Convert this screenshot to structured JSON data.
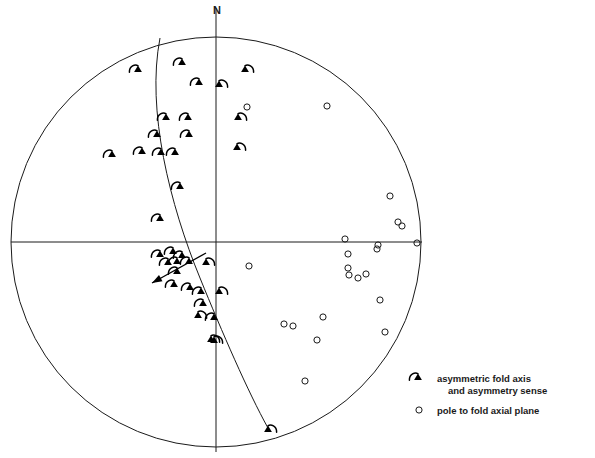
{
  "figure": {
    "name": "equal-area-stereonet",
    "orientation_label": "N",
    "net": {
      "center_x": 216,
      "center_y": 242,
      "radius": 205,
      "stroke": "#1a1a1a",
      "stroke_width": 1.0,
      "axis_vertical_top": 8,
      "axis_vertical_bottom": 452,
      "axis_horizontal_left": 11,
      "axis_horizontal_right": 422
    },
    "girdle": {
      "name": "best-fit-girdle-great-circle",
      "description": "great circle trace through fold axis cluster",
      "path": "M 160,38 C 146,110 170,205 200,278 C 222,332 248,392 268,428",
      "stroke": "#1a1a1a",
      "stroke_width": 1.0
    },
    "fold_axis_arrow": {
      "name": "mean-fold-axis-arrow",
      "x1": 206,
      "y1": 253,
      "x2": 152,
      "y2": 283,
      "stroke": "#000000"
    }
  },
  "chart_data": {
    "type": "scatter",
    "title": "",
    "xlabel": "",
    "ylabel": "",
    "projection": "lower-hemisphere equal-area stereographic net",
    "grid": false,
    "legend_position": "bottom-right",
    "series": [
      {
        "name": "asymmetric fold axis and asymmetry sense",
        "symbol": "filled-triangle-with-arc",
        "count": 35,
        "points": [
          {
            "x": 138,
            "y": 70,
            "sense": "left"
          },
          {
            "x": 182,
            "y": 63,
            "sense": "left"
          },
          {
            "x": 245,
            "y": 70,
            "sense": "right"
          },
          {
            "x": 199,
            "y": 83,
            "sense": "left"
          },
          {
            "x": 219,
            "y": 85,
            "sense": "right"
          },
          {
            "x": 166,
            "y": 118,
            "sense": "left"
          },
          {
            "x": 188,
            "y": 118,
            "sense": "left"
          },
          {
            "x": 238,
            "y": 118,
            "sense": "right"
          },
          {
            "x": 157,
            "y": 135,
            "sense": "left"
          },
          {
            "x": 189,
            "y": 135,
            "sense": "left"
          },
          {
            "x": 237,
            "y": 148,
            "sense": "right"
          },
          {
            "x": 112,
            "y": 155,
            "sense": "left"
          },
          {
            "x": 142,
            "y": 152,
            "sense": "left"
          },
          {
            "x": 161,
            "y": 153,
            "sense": "left"
          },
          {
            "x": 175,
            "y": 153,
            "sense": "left"
          },
          {
            "x": 180,
            "y": 187,
            "sense": "left"
          },
          {
            "x": 160,
            "y": 219,
            "sense": "left"
          },
          {
            "x": 160,
            "y": 255,
            "sense": "left"
          },
          {
            "x": 173,
            "y": 252,
            "sense": "left"
          },
          {
            "x": 182,
            "y": 256,
            "sense": "left"
          },
          {
            "x": 168,
            "y": 263,
            "sense": "left"
          },
          {
            "x": 177,
            "y": 262,
            "sense": "left"
          },
          {
            "x": 189,
            "y": 262,
            "sense": "left"
          },
          {
            "x": 206,
            "y": 263,
            "sense": "right"
          },
          {
            "x": 177,
            "y": 272,
            "sense": "left"
          },
          {
            "x": 174,
            "y": 285,
            "sense": "left"
          },
          {
            "x": 190,
            "y": 288,
            "sense": "left"
          },
          {
            "x": 219,
            "y": 292,
            "sense": "right"
          },
          {
            "x": 203,
            "y": 304,
            "sense": "left"
          },
          {
            "x": 198,
            "y": 316,
            "sense": "right"
          },
          {
            "x": 214,
            "y": 318,
            "sense": "left"
          },
          {
            "x": 211,
            "y": 340,
            "sense": "right"
          },
          {
            "x": 268,
            "y": 430,
            "sense": "right"
          },
          {
            "x": 201,
            "y": 292,
            "sense": "left"
          },
          {
            "x": 214,
            "y": 341,
            "sense": "right"
          }
        ]
      },
      {
        "name": "pole to fold axial plane",
        "symbol": "open-circle",
        "count": 22,
        "points": [
          {
            "x": 247,
            "y": 107
          },
          {
            "x": 327,
            "y": 106
          },
          {
            "x": 390,
            "y": 196
          },
          {
            "x": 398,
            "y": 222
          },
          {
            "x": 402,
            "y": 226
          },
          {
            "x": 417,
            "y": 243
          },
          {
            "x": 378,
            "y": 245
          },
          {
            "x": 377,
            "y": 249
          },
          {
            "x": 345,
            "y": 239
          },
          {
            "x": 348,
            "y": 254
          },
          {
            "x": 348,
            "y": 268
          },
          {
            "x": 349,
            "y": 275
          },
          {
            "x": 358,
            "y": 278
          },
          {
            "x": 366,
            "y": 274
          },
          {
            "x": 249,
            "y": 266
          },
          {
            "x": 284,
            "y": 324
          },
          {
            "x": 293,
            "y": 326
          },
          {
            "x": 323,
            "y": 317
          },
          {
            "x": 317,
            "y": 340
          },
          {
            "x": 385,
            "y": 332
          },
          {
            "x": 305,
            "y": 381
          },
          {
            "x": 380,
            "y": 300
          }
        ]
      }
    ]
  },
  "legend": {
    "name": "figure-legend",
    "entries": [
      {
        "symbol": "filled-triangle-with-arc",
        "line1": "asymmetric fold axis",
        "line2": "and asymmetry sense",
        "symbol_x": 418,
        "symbol_y": 378,
        "text_x": 437,
        "text_y": 375
      },
      {
        "symbol": "open-circle",
        "line1": "pole to fold axial plane",
        "line2": "",
        "symbol_x": 419,
        "symbol_y": 410,
        "text_x": 437,
        "text_y": 414
      }
    ]
  },
  "colors": {
    "ink": "#1a1a1a",
    "symbol_fill": "#000000",
    "background": "#ffffff"
  }
}
